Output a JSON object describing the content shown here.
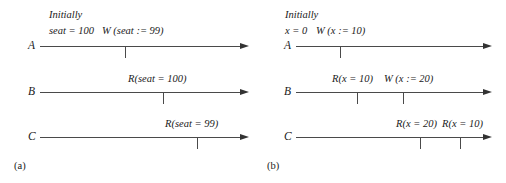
{
  "figure": {
    "width": 506,
    "height": 183,
    "background": "#ffffff",
    "line_color": "#4a4a4a",
    "text_color": "#1a1a1a"
  },
  "panels": [
    {
      "id": "a",
      "caption": "(a)",
      "initially_label": "Initially",
      "initial_state": "seat = 100",
      "processes": [
        {
          "name": "A",
          "operations": [
            {
              "label": "W (seat := 99)",
              "kind": "write"
            }
          ]
        },
        {
          "name": "B",
          "operations": [
            {
              "label": "R(seat = 100)",
              "kind": "read"
            }
          ]
        },
        {
          "name": "C",
          "operations": [
            {
              "label": "R(seat = 99)",
              "kind": "read"
            }
          ]
        }
      ]
    },
    {
      "id": "b",
      "caption": "(b)",
      "initially_label": "Initially",
      "initial_state": "x = 0",
      "processes": [
        {
          "name": "A",
          "operations": [
            {
              "label": "W (x := 10)",
              "kind": "write"
            }
          ]
        },
        {
          "name": "B",
          "operations": [
            {
              "label": "R(x = 10)",
              "kind": "read"
            },
            {
              "label": "W (x := 20)",
              "kind": "write"
            }
          ]
        },
        {
          "name": "C",
          "operations": [
            {
              "label": "R(x = 20)",
              "kind": "read"
            },
            {
              "label": "R(x = 10)",
              "kind": "read"
            }
          ]
        }
      ]
    }
  ]
}
